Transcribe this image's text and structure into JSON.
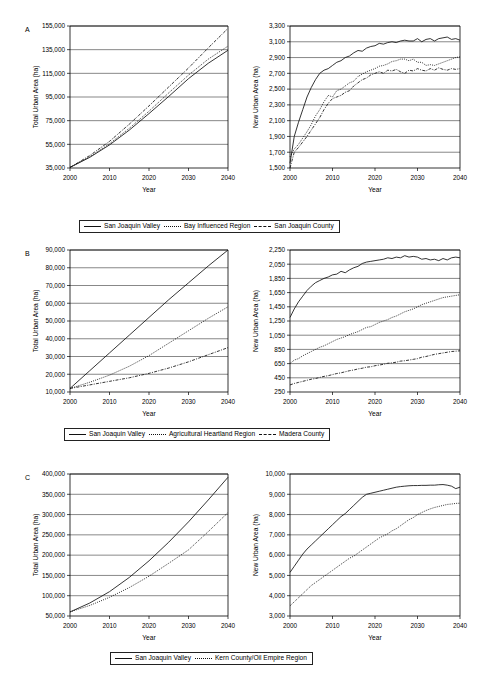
{
  "figure": {
    "panels": [
      {
        "label": "A",
        "legend": [
          {
            "name": "San Joaquin Valley",
            "style": "solid"
          },
          {
            "name": "Bay Influenced Region",
            "style": "dotted"
          },
          {
            "name": "San Joaquin County",
            "style": "dashdot"
          }
        ]
      },
      {
        "label": "B",
        "legend": [
          {
            "name": "San Joaquin Valley",
            "style": "solid"
          },
          {
            "name": "Agricultural Heartland Region",
            "style": "dotted"
          },
          {
            "name": "Madera County",
            "style": "dashdot"
          }
        ]
      },
      {
        "label": "C",
        "legend": [
          {
            "name": "San Joaquin Valley",
            "style": "solid"
          },
          {
            "name": "Kern County/Oil Empire Region",
            "style": "dotted"
          }
        ]
      }
    ]
  },
  "chart_data": [
    {
      "id": "A-left",
      "type": "line",
      "title": "",
      "xlabel": "Year",
      "ylabel": "Total Urban Area (ha)",
      "xlim": [
        2000,
        2040
      ],
      "ylim": [
        35000,
        155000
      ],
      "xticks": [
        2000,
        2010,
        2020,
        2030,
        2040
      ],
      "yticks": [
        35000,
        55000,
        75000,
        95000,
        115000,
        135000,
        155000
      ],
      "ytick_labels": [
        "35,000",
        "55,000",
        "75,000",
        "95,000",
        "115,000",
        "135,000",
        "155,000"
      ],
      "grid": true,
      "legend_position": "below",
      "x": [
        2000,
        2005,
        2010,
        2015,
        2020,
        2025,
        2030,
        2035,
        2040
      ],
      "series": [
        {
          "name": "San Joaquin Valley",
          "style": "solid",
          "values": [
            35500,
            44000,
            54500,
            67000,
            81000,
            95500,
            110500,
            123500,
            134500
          ]
        },
        {
          "name": "Bay Influenced Region",
          "style": "dotted",
          "values": [
            35500,
            44500,
            55500,
            68500,
            83000,
            98500,
            113500,
            127000,
            138000
          ]
        },
        {
          "name": "San Joaquin County",
          "style": "dashdot",
          "values": [
            35500,
            45500,
            57500,
            72000,
            87500,
            103500,
            119500,
            136500,
            153000
          ]
        }
      ]
    },
    {
      "id": "A-right",
      "type": "line",
      "title": "",
      "xlabel": "Year",
      "ylabel": "New Urban Area (ha)",
      "xlim": [
        2000,
        2040
      ],
      "ylim": [
        1500,
        3300
      ],
      "xticks": [
        2000,
        2010,
        2020,
        2030,
        2040
      ],
      "yticks": [
        1500,
        1700,
        1900,
        2100,
        2300,
        2500,
        2700,
        2900,
        3100,
        3300
      ],
      "ytick_labels": [
        "1,500",
        "1,700",
        "1,900",
        "2,100",
        "2,300",
        "2,500",
        "2,700",
        "2,900",
        "3,100",
        "3,300"
      ],
      "grid": true,
      "legend_position": "below",
      "x": [
        2000,
        2001,
        2002,
        2003,
        2004,
        2005,
        2006,
        2007,
        2008,
        2009,
        2010,
        2011,
        2012,
        2013,
        2014,
        2015,
        2016,
        2017,
        2018,
        2019,
        2020,
        2021,
        2022,
        2023,
        2024,
        2025,
        2026,
        2027,
        2028,
        2029,
        2030,
        2031,
        2032,
        2033,
        2034,
        2035,
        2036,
        2037,
        2038,
        2039,
        2040
      ],
      "series": [
        {
          "name": "San Joaquin Valley",
          "style": "solid",
          "values": [
            1560,
            1900,
            2080,
            2240,
            2400,
            2520,
            2620,
            2700,
            2740,
            2760,
            2800,
            2840,
            2860,
            2900,
            2920,
            2960,
            2990,
            2980,
            3020,
            3040,
            3050,
            3080,
            3070,
            3090,
            3100,
            3090,
            3110,
            3120,
            3110,
            3110,
            3140,
            3100,
            3130,
            3140,
            3110,
            3140,
            3150,
            3160,
            3130,
            3140,
            3120
          ]
        },
        {
          "name": "Bay Influenced Region",
          "style": "dotted",
          "values": [
            1640,
            1740,
            1800,
            1880,
            1960,
            2050,
            2160,
            2240,
            2340,
            2420,
            2400,
            2480,
            2500,
            2540,
            2580,
            2600,
            2660,
            2690,
            2720,
            2740,
            2760,
            2790,
            2800,
            2820,
            2850,
            2860,
            2880,
            2880,
            2860,
            2880,
            2840,
            2840,
            2800,
            2810,
            2800,
            2820,
            2840,
            2860,
            2880,
            2900,
            2910
          ]
        },
        {
          "name": "San Joaquin County",
          "style": "dashdot",
          "values": [
            1500,
            1700,
            1760,
            1830,
            1900,
            1980,
            2060,
            2140,
            2240,
            2320,
            2380,
            2400,
            2420,
            2460,
            2480,
            2540,
            2580,
            2620,
            2640,
            2680,
            2700,
            2720,
            2700,
            2740,
            2730,
            2750,
            2720,
            2700,
            2740,
            2730,
            2760,
            2740,
            2730,
            2760,
            2740,
            2770,
            2750,
            2740,
            2760,
            2750,
            2760
          ]
        }
      ]
    },
    {
      "id": "B-left",
      "type": "line",
      "title": "",
      "xlabel": "Year",
      "ylabel": "Total Urban Area (ha)",
      "xlim": [
        2000,
        2040
      ],
      "ylim": [
        10000,
        90000
      ],
      "xticks": [
        2000,
        2010,
        2020,
        2030,
        2040
      ],
      "yticks": [
        10000,
        20000,
        30000,
        40000,
        50000,
        60000,
        70000,
        80000,
        90000
      ],
      "ytick_labels": [
        "10,000",
        "20,000",
        "30,000",
        "40,000",
        "50,000",
        "60,000",
        "70,000",
        "80,000",
        "90,000"
      ],
      "grid": true,
      "legend_position": "below",
      "x": [
        2000,
        2005,
        2010,
        2015,
        2020,
        2025,
        2030,
        2035,
        2040
      ],
      "series": [
        {
          "name": "San Joaquin Valley",
          "style": "solid",
          "values": [
            12000,
            22000,
            32000,
            42000,
            52000,
            62000,
            71500,
            81000,
            90000
          ]
        },
        {
          "name": "Agricultural Heartland Region",
          "style": "dotted",
          "values": [
            12000,
            15500,
            19500,
            24500,
            30500,
            37500,
            44500,
            51500,
            58000
          ]
        },
        {
          "name": "Madera County",
          "style": "dashdot",
          "values": [
            12000,
            14000,
            16000,
            18000,
            20500,
            23500,
            27000,
            31000,
            35000
          ]
        }
      ]
    },
    {
      "id": "B-right",
      "type": "line",
      "title": "",
      "xlabel": "Year",
      "ylabel": "New Urban Area (ha)",
      "xlim": [
        2000,
        2040
      ],
      "ylim": [
        250,
        2250
      ],
      "xticks": [
        2000,
        2010,
        2020,
        2030,
        2040
      ],
      "yticks": [
        250,
        450,
        650,
        850,
        1050,
        1250,
        1450,
        1650,
        1850,
        2050,
        2250
      ],
      "ytick_labels": [
        "250",
        "450",
        "650",
        "850",
        "1,050",
        "1,250",
        "1,450",
        "1,650",
        "1,850",
        "2,050",
        "2,250"
      ],
      "grid": true,
      "legend_position": "below",
      "x": [
        2000,
        2001,
        2002,
        2003,
        2004,
        2005,
        2006,
        2007,
        2008,
        2009,
        2010,
        2011,
        2012,
        2013,
        2014,
        2015,
        2016,
        2017,
        2018,
        2019,
        2020,
        2021,
        2022,
        2023,
        2024,
        2025,
        2026,
        2027,
        2028,
        2029,
        2030,
        2031,
        2032,
        2033,
        2034,
        2035,
        2036,
        2037,
        2038,
        2039,
        2040
      ],
      "series": [
        {
          "name": "San Joaquin Valley",
          "style": "solid",
          "values": [
            1300,
            1420,
            1520,
            1600,
            1680,
            1740,
            1790,
            1820,
            1850,
            1870,
            1900,
            1910,
            1950,
            1930,
            1970,
            2000,
            2020,
            2060,
            2080,
            2090,
            2100,
            2110,
            2120,
            2140,
            2130,
            2150,
            2140,
            2170,
            2150,
            2160,
            2150,
            2120,
            2130,
            2110,
            2120,
            2100,
            2130,
            2110,
            2140,
            2150,
            2140
          ]
        },
        {
          "name": "Agricultural Heartland Region",
          "style": "dotted",
          "values": [
            650,
            700,
            720,
            760,
            790,
            820,
            850,
            880,
            900,
            930,
            960,
            990,
            1010,
            1030,
            1060,
            1080,
            1100,
            1130,
            1160,
            1170,
            1200,
            1230,
            1250,
            1270,
            1300,
            1320,
            1350,
            1380,
            1400,
            1420,
            1450,
            1480,
            1500,
            1520,
            1540,
            1560,
            1580,
            1590,
            1600,
            1610,
            1620
          ]
        },
        {
          "name": "Madera County",
          "style": "dashdot",
          "values": [
            350,
            370,
            385,
            400,
            415,
            430,
            440,
            455,
            470,
            480,
            495,
            510,
            520,
            535,
            550,
            560,
            575,
            585,
            600,
            605,
            620,
            630,
            640,
            655,
            660,
            670,
            685,
            690,
            700,
            710,
            720,
            740,
            750,
            765,
            780,
            790,
            800,
            810,
            820,
            825,
            830
          ]
        }
      ]
    },
    {
      "id": "C-left",
      "type": "line",
      "title": "",
      "xlabel": "Year",
      "ylabel": "Total Urban Area (ha)",
      "xlim": [
        2000,
        2040
      ],
      "ylim": [
        50000,
        400000
      ],
      "xticks": [
        2000,
        2010,
        2020,
        2030,
        2040
      ],
      "yticks": [
        50000,
        100000,
        150000,
        200000,
        250000,
        300000,
        350000,
        400000
      ],
      "ytick_labels": [
        "50,000",
        "100,000",
        "150,000",
        "200,000",
        "250,000",
        "300,000",
        "350,000",
        "400,000"
      ],
      "grid": true,
      "legend_position": "below",
      "x": [
        2000,
        2005,
        2010,
        2015,
        2020,
        2025,
        2030,
        2035,
        2040
      ],
      "series": [
        {
          "name": "San Joaquin Valley",
          "style": "solid",
          "values": [
            60000,
            82000,
            110000,
            145000,
            186000,
            232000,
            282000,
            336000,
            392000
          ]
        },
        {
          "name": "Kern County/Oil Empire Region",
          "style": "dotted",
          "values": [
            60000,
            76000,
            96000,
            120000,
            148000,
            180000,
            213000,
            258000,
            305000
          ]
        }
      ]
    },
    {
      "id": "C-right",
      "type": "line",
      "title": "",
      "xlabel": "Year",
      "ylabel": "New Urban Area (ha)",
      "xlim": [
        2000,
        2040
      ],
      "ylim": [
        3000,
        10000
      ],
      "xticks": [
        2000,
        2010,
        2020,
        2030,
        2040
      ],
      "yticks": [
        3000,
        4000,
        5000,
        6000,
        7000,
        8000,
        9000,
        10000
      ],
      "ytick_labels": [
        "3,000",
        "4,000",
        "5,000",
        "6,000",
        "7,000",
        "8,000",
        "9,000",
        "10,000"
      ],
      "grid": true,
      "legend_position": "below",
      "x": [
        2000,
        2001,
        2002,
        2003,
        2004,
        2005,
        2006,
        2007,
        2008,
        2009,
        2010,
        2011,
        2012,
        2013,
        2014,
        2015,
        2016,
        2017,
        2018,
        2019,
        2020,
        2021,
        2022,
        2023,
        2024,
        2025,
        2026,
        2027,
        2028,
        2029,
        2030,
        2031,
        2032,
        2033,
        2034,
        2035,
        2036,
        2037,
        2038,
        2039,
        2040
      ],
      "series": [
        {
          "name": "San Joaquin Valley",
          "style": "solid",
          "values": [
            5150,
            5450,
            5750,
            6050,
            6300,
            6500,
            6700,
            6900,
            7100,
            7300,
            7500,
            7700,
            7900,
            8050,
            8250,
            8450,
            8650,
            8850,
            9000,
            9050,
            9100,
            9150,
            9200,
            9250,
            9300,
            9350,
            9380,
            9400,
            9420,
            9430,
            9430,
            9440,
            9440,
            9450,
            9450,
            9470,
            9480,
            9450,
            9400,
            9280,
            9350
          ]
        },
        {
          "name": "Kern County/Oil Empire Region",
          "style": "dotted",
          "values": [
            3500,
            3700,
            3900,
            4100,
            4300,
            4500,
            4650,
            4800,
            4950,
            5100,
            5250,
            5400,
            5550,
            5700,
            5850,
            5950,
            6100,
            6250,
            6400,
            6550,
            6700,
            6850,
            6950,
            7050,
            7200,
            7300,
            7450,
            7600,
            7750,
            7850,
            8000,
            8100,
            8200,
            8280,
            8350,
            8400,
            8450,
            8500,
            8520,
            8550,
            8560
          ]
        }
      ]
    }
  ]
}
